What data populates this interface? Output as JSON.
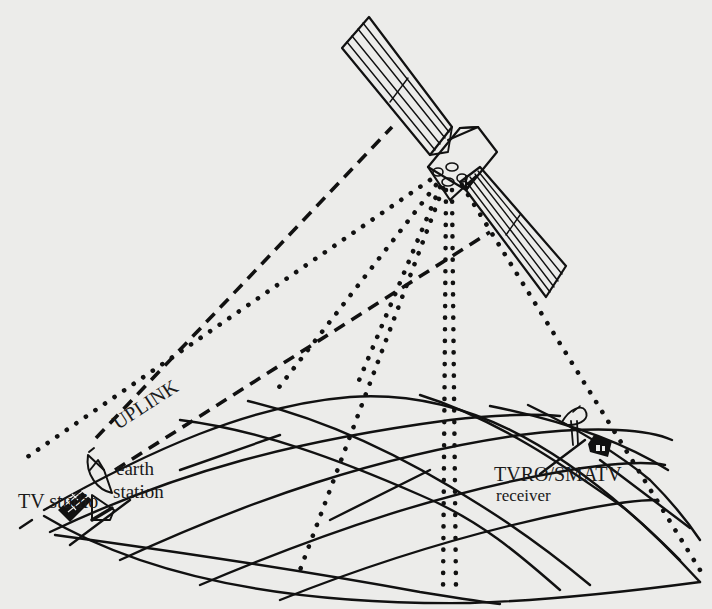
{
  "diagram": {
    "type": "satellite-broadcast-system",
    "background_color": "#ececea",
    "ink_color": "#111111",
    "labels": {
      "uplink": "UPLINK",
      "earth_station_1": "earth",
      "earth_station_2": "station",
      "tv_studio": "TV studio",
      "receiver_1": "TVRO/SMATV",
      "receiver_2": "receiver"
    },
    "elements": [
      {
        "name": "satellite",
        "icon": "satellite-icon"
      },
      {
        "name": "uplink-beams",
        "style": "dashed",
        "count": 2
      },
      {
        "name": "downlink-beams",
        "style": "dotted",
        "count": 7
      },
      {
        "name": "earth-surface-grid",
        "style": "curved-grid"
      },
      {
        "name": "earth-station-dish",
        "icon": "dish-icon"
      },
      {
        "name": "tv-studio-building",
        "icon": "building-icon"
      },
      {
        "name": "receiver-dish",
        "icon": "dish-icon"
      },
      {
        "name": "receiver-house",
        "icon": "house-icon"
      }
    ]
  }
}
